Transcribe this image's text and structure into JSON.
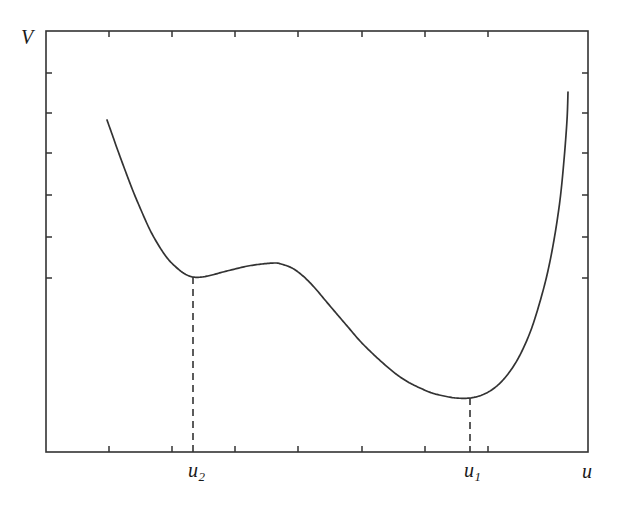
{
  "figure": {
    "background": "#ffffff",
    "line_color": "#333333",
    "axis_color": "#333333"
  },
  "labels": {
    "y_axis": "V",
    "x_axis": "u",
    "minimum_global": {
      "base": "u",
      "sub": "1"
    },
    "minimum_local": {
      "base": "u",
      "sub": "2"
    }
  },
  "chart_data": {
    "type": "line",
    "title": "",
    "xlabel": "u",
    "ylabel": "V",
    "grid": false,
    "legend": null,
    "axis_ticks_only": true,
    "tick_labels_x": [
      "",
      "",
      "",
      "",
      "",
      "",
      ""
    ],
    "tick_labels_y": [
      "",
      "",
      "",
      "",
      "",
      ""
    ],
    "annotations": [
      {
        "text": "u2",
        "kind": "dashed-drop-line",
        "x_px": 193,
        "y_top_px": 277,
        "y_bottom_px": 452,
        "meaning": "local minimum / metastable state"
      },
      {
        "text": "u1",
        "kind": "dashed-drop-line",
        "x_px": 470,
        "y_top_px": 398,
        "y_bottom_px": 452,
        "meaning": "global minimum / stable state"
      }
    ],
    "features": [
      {
        "name": "left-branch-start",
        "x": 107,
        "y": 120
      },
      {
        "name": "local-minimum-u2",
        "x": 193,
        "y": 277
      },
      {
        "name": "local-maximum",
        "x": 281,
        "y": 264
      },
      {
        "name": "inflection",
        "x": 370,
        "y": 320
      },
      {
        "name": "global-minimum-u1",
        "x": 470,
        "y": 398
      },
      {
        "name": "right-branch-end",
        "x": 568,
        "y": 92
      }
    ],
    "series": [
      {
        "name": "V(u)",
        "points": [
          [
            107,
            120
          ],
          [
            112,
            134
          ],
          [
            118,
            151
          ],
          [
            125,
            170
          ],
          [
            133,
            191
          ],
          [
            141,
            210
          ],
          [
            150,
            230
          ],
          [
            159,
            246
          ],
          [
            168,
            259
          ],
          [
            177,
            268
          ],
          [
            185,
            274
          ],
          [
            193,
            277
          ],
          [
            202,
            277
          ],
          [
            212,
            275
          ],
          [
            223,
            272
          ],
          [
            235,
            269
          ],
          [
            248,
            266
          ],
          [
            262,
            264
          ],
          [
            275,
            263
          ],
          [
            281,
            264
          ],
          [
            292,
            268
          ],
          [
            303,
            276
          ],
          [
            314,
            287
          ],
          [
            325,
            300
          ],
          [
            336,
            313
          ],
          [
            348,
            327
          ],
          [
            360,
            341
          ],
          [
            372,
            353
          ],
          [
            384,
            364
          ],
          [
            396,
            374
          ],
          [
            408,
            382
          ],
          [
            420,
            388
          ],
          [
            432,
            393
          ],
          [
            444,
            396
          ],
          [
            456,
            398
          ],
          [
            470,
            398
          ],
          [
            482,
            395
          ],
          [
            493,
            389
          ],
          [
            503,
            380
          ],
          [
            513,
            367
          ],
          [
            522,
            351
          ],
          [
            531,
            330
          ],
          [
            539,
            305
          ],
          [
            547,
            275
          ],
          [
            554,
            240
          ],
          [
            560,
            200
          ],
          [
            564,
            160
          ],
          [
            567,
            120
          ],
          [
            568,
            92
          ]
        ],
        "x_range_px": [
          107,
          568
        ],
        "y_range_px": [
          92,
          398
        ]
      }
    ],
    "frame": {
      "left_px": 46,
      "right_px": 588,
      "top_px": 31,
      "bottom_px": 452
    },
    "ticks": {
      "bottom_x_px": [
        109,
        172,
        235,
        298,
        362,
        425,
        488
      ],
      "left_y_px": [
        73,
        113,
        153,
        195,
        237,
        278
      ],
      "right_y_px": [
        73,
        113,
        153,
        195,
        237,
        278
      ],
      "top_x_px": [
        109,
        172,
        235,
        298,
        362,
        425,
        488
      ],
      "length_px": 6
    }
  }
}
